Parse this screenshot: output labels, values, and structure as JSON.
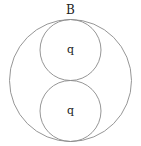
{
  "diagram": {
    "outer_circle": {
      "cx": 70.5,
      "cy": 80.5,
      "r": 61,
      "label": "B"
    },
    "inner_circles": [
      {
        "cx": 70.5,
        "cy": 50,
        "r": 30.5,
        "label": "q"
      },
      {
        "cx": 70.5,
        "cy": 111,
        "r": 30.5,
        "label": "q"
      }
    ],
    "stroke_color": "#8a8a8a"
  }
}
